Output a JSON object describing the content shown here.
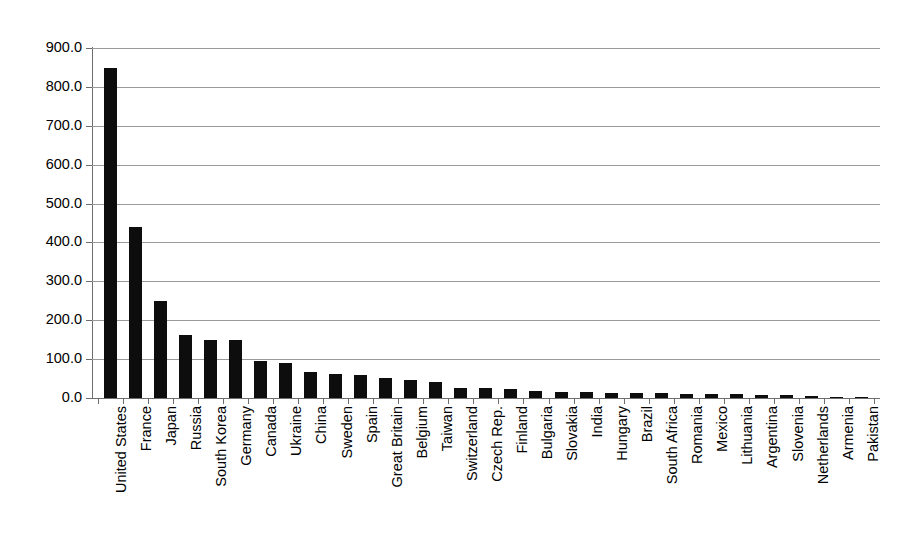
{
  "chart_data": {
    "type": "bar",
    "title": "",
    "subtitle": "",
    "xlabel": "",
    "ylabel": "",
    "ylim": [
      0,
      900
    ],
    "ytick_step": 100,
    "ytick_labels": [
      "0.0",
      "100.0",
      "200.0",
      "300.0",
      "400.0",
      "500.0",
      "600.0",
      "700.0",
      "800.0",
      "900.0"
    ],
    "grid": true,
    "legend": "none",
    "bar_color": "#0d0d0d",
    "gridline_color": "#9a9a9a",
    "axis_color": "#6d6d6d",
    "background_color": "#ffffff",
    "categories": [
      "United States",
      "France",
      "Japan",
      "Russia",
      "South Korea",
      "Germany",
      "Canada",
      "Ukraine",
      "China",
      "Sweden",
      "Spain",
      "Great Britain",
      "Belgium",
      "Taiwan",
      "Switzerland",
      "Czech Rep.",
      "Finland",
      "Bulgaria",
      "Slovakia",
      "India",
      "Hungary",
      "Brazil",
      "South Africa",
      "Romania",
      "Mexico",
      "Lithuania",
      "Argentina",
      "Slovenia",
      "Netherlands",
      "Armenia",
      "Pakistan"
    ],
    "values": [
      848.0,
      440.0,
      250.0,
      163.0,
      150.0,
      149.0,
      94.0,
      90.0,
      68.0,
      62.0,
      58.0,
      52.0,
      46.0,
      40.0,
      26.0,
      25.0,
      23.0,
      17.0,
      16.0,
      15.0,
      14.0,
      13.0,
      12.0,
      11.0,
      11.0,
      11.0,
      8.0,
      7.0,
      6.0,
      2.0,
      2.0
    ]
  }
}
